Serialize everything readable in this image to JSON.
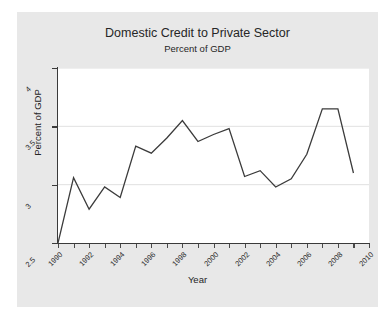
{
  "chart_data": {
    "type": "line",
    "title": "Domestic Credit to Private Sector",
    "subtitle": "Percent of GDP",
    "xlabel": "Year",
    "ylabel": "Percent of GDP",
    "xlim": [
      1990,
      2010
    ],
    "ylim": [
      2.5,
      4.0
    ],
    "yticks": [
      2.5,
      3,
      3.5,
      4
    ],
    "ytick_labels": [
      "2.5",
      "3",
      "3.5",
      "4"
    ],
    "xticks": [
      1990,
      1992,
      1994,
      1996,
      1998,
      2000,
      2002,
      2004,
      2006,
      2008,
      2010
    ],
    "xtick_labels": [
      "1990",
      "1992",
      "1994",
      "1996",
      "1998",
      "2000",
      "2002",
      "2004",
      "2006",
      "2008",
      "2010"
    ],
    "xtick_minor_step": 1,
    "grid": "horizontal-only",
    "grid_color": "#d8d8d8",
    "legend": null,
    "line_color": "#3b3b3b",
    "line_width": 1.3,
    "background": "#ffffff",
    "figure_background": "#e8e8e8",
    "x": [
      1990,
      1991,
      1992,
      1993,
      1994,
      1995,
      1996,
      1997,
      1998,
      1999,
      2000,
      2001,
      2002,
      2003,
      2004,
      2005,
      2006,
      2007,
      2008,
      2009
    ],
    "values": [
      2.5,
      3.06,
      2.79,
      2.98,
      2.89,
      3.33,
      3.27,
      3.4,
      3.55,
      3.37,
      3.43,
      3.48,
      3.07,
      3.12,
      2.98,
      3.05,
      3.26,
      3.65,
      3.65,
      3.1
    ],
    "series": [
      {
        "name": "Domestic credit to private sector (% of GDP)",
        "values": [
          2.5,
          3.06,
          2.79,
          2.98,
          2.89,
          3.33,
          3.27,
          3.4,
          3.55,
          3.37,
          3.43,
          3.48,
          3.07,
          3.12,
          2.98,
          3.05,
          3.26,
          3.65,
          3.65,
          3.1
        ]
      }
    ]
  }
}
